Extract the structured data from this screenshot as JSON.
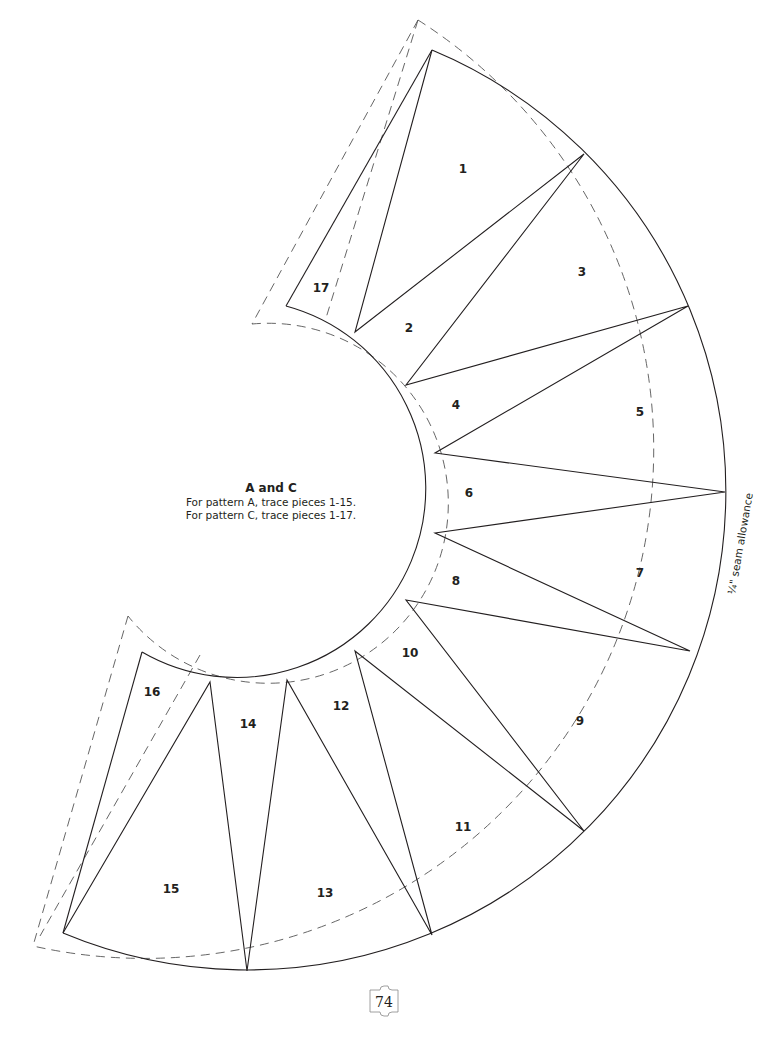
{
  "pattern": {
    "title": "A and C",
    "line1": "For pattern A, trace pieces 1-15.",
    "line2": "For pattern C, trace pieces 1-17.",
    "seam_label": "¼\" seam allowance",
    "page_number": "74",
    "pieces": [
      "1",
      "2",
      "3",
      "4",
      "5",
      "6",
      "7",
      "8",
      "9",
      "10",
      "11",
      "12",
      "13",
      "14",
      "15",
      "16",
      "17"
    ]
  }
}
